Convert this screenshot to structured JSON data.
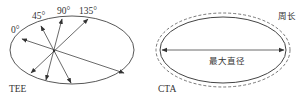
{
  "diagram": {
    "colors": {
      "stroke": "#444444",
      "text": "#333333",
      "background": "#ffffff"
    },
    "left_panel": {
      "label": "TEE",
      "angles": [
        "0°",
        "45°",
        "90°",
        "135°"
      ],
      "description": "Ellipse with four diameters through a common point at 0°, 45°, 90°, 135°"
    },
    "right_panel": {
      "label": "CTA",
      "perimeter_label": "周长",
      "max_diameter_label": "最大直径",
      "description": "Ellipse with dashed perimeter outline and horizontal maximum diameter arrow"
    }
  }
}
